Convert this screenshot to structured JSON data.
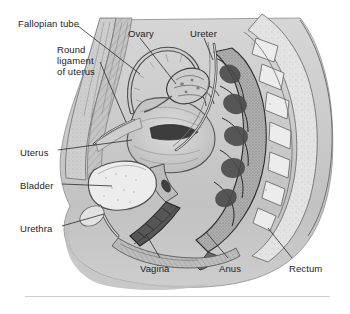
{
  "figure": {
    "type": "anatomical-illustration",
    "style": "grayscale scanned line drawing with stipple and hatch shading",
    "background_color": "#ffffff",
    "tissue_color": "#c8c8c8",
    "ink_color": "#3a3a3a",
    "label_color": "#1d1d1d",
    "labels": [
      {
        "name": "fallopian-tube",
        "text": "Fallopian tube",
        "x": 18,
        "y": 18
      },
      {
        "name": "ovary",
        "text": "Ovary",
        "x": 128,
        "y": 28
      },
      {
        "name": "ureter",
        "text": "Ureter",
        "x": 190,
        "y": 28
      },
      {
        "name": "round-ligament-of-uterus",
        "text": "Round\nligament\nof uterus",
        "x": 57,
        "y": 44
      },
      {
        "name": "uterus",
        "text": "Uterus",
        "x": 20,
        "y": 147
      },
      {
        "name": "bladder",
        "text": "Bladder",
        "x": 20,
        "y": 180
      },
      {
        "name": "urethra",
        "text": "Urethra",
        "x": 20,
        "y": 223
      },
      {
        "name": "vagina",
        "text": "Vagina",
        "x": 140,
        "y": 263
      },
      {
        "name": "anus",
        "text": "Anus",
        "x": 219,
        "y": 263
      },
      {
        "name": "rectum",
        "text": "Rectum",
        "x": 289,
        "y": 263
      }
    ],
    "footer_rule": {
      "visible": true,
      "color": "#cfcfcf"
    }
  }
}
